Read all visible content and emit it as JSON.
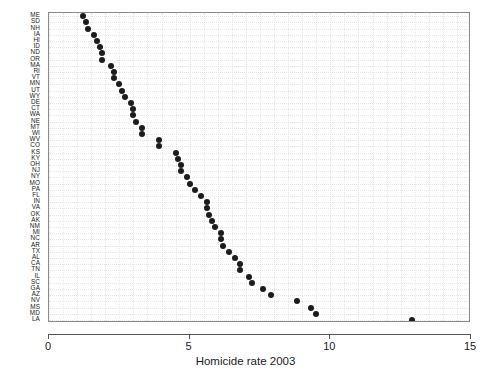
{
  "chart_data": {
    "type": "scatter",
    "title": "",
    "subtitle": "",
    "xlabel": "Homicide rate 2003",
    "ylabel": "",
    "xlim": [
      0,
      15
    ],
    "xticks": [
      0,
      5,
      10,
      15
    ],
    "xticklabels": [
      "0",
      "5",
      "10",
      "15"
    ],
    "grid": true,
    "grid_style": "dotted",
    "legend": "none",
    "orientation": "horizontal-dotplot",
    "sort": "ascending by value",
    "categories": [
      "ME",
      "SD",
      "NH",
      "IA",
      "HI",
      "ID",
      "ND",
      "OR",
      "MA",
      "RI",
      "VT",
      "MN",
      "UT",
      "WY",
      "DE",
      "CT",
      "WA",
      "NE",
      "MT",
      "WI",
      "WV",
      "CO",
      "KS",
      "KY",
      "OH",
      "NJ",
      "NY",
      "MO",
      "PA",
      "FL",
      "IN",
      "VA",
      "OK",
      "AK",
      "NM",
      "MI",
      "NC",
      "AR",
      "TX",
      "AL",
      "CA",
      "TN",
      "IL",
      "SC",
      "GA",
      "AZ",
      "NV",
      "MS",
      "MD",
      "LA"
    ],
    "values": [
      1.2,
      1.3,
      1.4,
      1.6,
      1.7,
      1.8,
      1.9,
      1.9,
      2.2,
      2.3,
      2.3,
      2.5,
      2.6,
      2.7,
      2.9,
      3.0,
      3.0,
      3.1,
      3.3,
      3.3,
      3.9,
      3.9,
      4.5,
      4.6,
      4.7,
      4.7,
      4.9,
      5.0,
      5.2,
      5.4,
      5.6,
      5.6,
      5.7,
      5.8,
      5.9,
      6.1,
      6.1,
      6.2,
      6.4,
      6.6,
      6.8,
      6.8,
      7.1,
      7.2,
      7.6,
      7.9,
      8.8,
      9.3,
      9.5,
      12.9
    ]
  },
  "axis": {
    "x_title": "Homicide rate 2003"
  }
}
